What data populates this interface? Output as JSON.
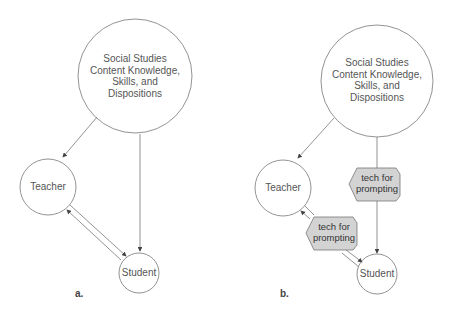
{
  "panels": {
    "a": {
      "label": "a.",
      "nodes": {
        "content": "Social Studies Content Knowledge, Skills, and Dispositions",
        "content_lines": [
          "Social Studies",
          "Content Knowledge,",
          "Skills, and",
          "Dispositions"
        ],
        "teacher": "Teacher",
        "student": "Student"
      },
      "edges": [
        {
          "from": "content",
          "to": "teacher"
        },
        {
          "from": "content",
          "to": "student"
        },
        {
          "from": "teacher",
          "to": "student"
        },
        {
          "from": "student",
          "to": "teacher"
        }
      ]
    },
    "b": {
      "label": "b.",
      "nodes": {
        "content_lines": [
          "Social Studies",
          "Content Knowledge,",
          "Skills, and",
          "Dispositions"
        ],
        "teacher": "Teacher",
        "student": "Student",
        "mediator_1": "tech for prompting",
        "mediator_1_lines": [
          "tech for",
          "prompting"
        ],
        "mediator_2": "tech for prompting",
        "mediator_2_lines": [
          "tech for",
          "prompting"
        ]
      },
      "edges": [
        {
          "from": "content",
          "to": "teacher"
        },
        {
          "from": "content",
          "to": "student",
          "via": "tech for prompting"
        },
        {
          "from": "teacher",
          "to": "student",
          "via": "tech for prompting"
        },
        {
          "from": "student",
          "to": "teacher",
          "via": "tech for prompting"
        }
      ]
    }
  },
  "colors": {
    "stroke": "#777777",
    "hex_fill": "#d3d3d3",
    "text": "#555555"
  }
}
